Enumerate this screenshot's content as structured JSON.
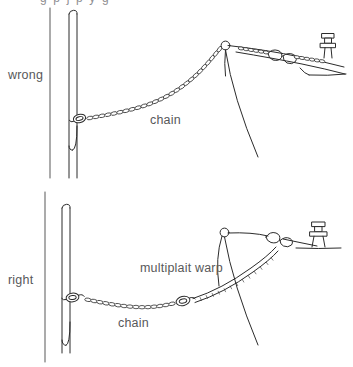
{
  "figure": {
    "background_color": "#ffffff",
    "ink_color": "#2b2b2b",
    "label_color": "#58585a",
    "top_cropped_text": "g  p  j  p  y  g",
    "panels": [
      {
        "id": "wrong",
        "side_label": "wrong",
        "labels": [
          {
            "name": "chain",
            "text": "chain",
            "x": 150,
            "y": 120
          }
        ],
        "description": "Boat moored to a piling with chain running all the way from the ring on the post to the bow roller; the chain is bar-taut over the stemhead.",
        "elements": [
          "mooring-post",
          "mooring-ring",
          "chain-rode",
          "bow-roller",
          "boat-bow",
          "deck-fairlead",
          "mooring-bollard",
          "waterline"
        ]
      },
      {
        "id": "right",
        "side_label": "right",
        "labels": [
          {
            "name": "multiplait-warp",
            "text": "multiplait  warp",
            "x": 140,
            "y": 268
          },
          {
            "name": "chain",
            "text": "chain",
            "x": 118,
            "y": 323
          }
        ],
        "description": "Boat moored to a piling with a short length of chain from the ring joined by a shackle to a multiplait warp, which leads over the bow roller to the cleat so the rope takes the snatch.",
        "elements": [
          "mooring-post",
          "mooring-ring",
          "chain-rode",
          "shackle",
          "multiplait-warp",
          "bow-roller",
          "boat-bow",
          "deck-fairlead",
          "mooring-bollard",
          "waterline"
        ]
      }
    ]
  }
}
